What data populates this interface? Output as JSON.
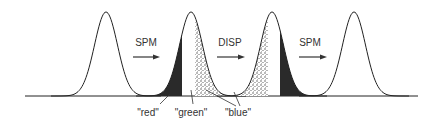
{
  "diagram": {
    "baseline": {
      "x1": 25,
      "x2": 418,
      "y": 96
    },
    "pulses": [
      {
        "id": "pulse-1",
        "cx": 106,
        "fills": []
      },
      {
        "id": "pulse-2",
        "cx": 191,
        "fills": [
          {
            "kind": "solid",
            "from": "left",
            "to": 182
          },
          {
            "kind": "speckle",
            "from": 195,
            "to": "right"
          }
        ]
      },
      {
        "id": "pulse-3",
        "cx": 272,
        "fills": [
          {
            "kind": "speckle",
            "from": "left",
            "to": 268
          },
          {
            "kind": "solid",
            "from": 280,
            "to": "right"
          }
        ]
      },
      {
        "id": "pulse-4",
        "cx": 354,
        "fills": []
      }
    ],
    "operations": [
      {
        "label": "SPM",
        "x": 146,
        "arrow_x1": 133,
        "arrow_x2": 160
      },
      {
        "label": "DISP",
        "x": 230,
        "arrow_x1": 217,
        "arrow_x2": 245
      },
      {
        "label": "SPM",
        "x": 310,
        "arrow_x1": 299,
        "arrow_x2": 327
      }
    ],
    "components": [
      {
        "label": "\"red\"",
        "x": 148
      },
      {
        "label": "\"green\"",
        "x": 191
      },
      {
        "label": "\"blue\"",
        "x": 238
      }
    ],
    "colors": {
      "line": "#222222",
      "fill": "#2a2a2a",
      "speckle": "#555555",
      "background": "#ffffff"
    }
  }
}
